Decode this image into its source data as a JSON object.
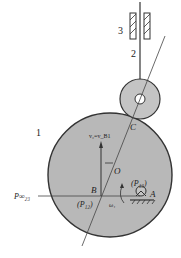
{
  "diagram": {
    "type": "cam-follower-mechanism",
    "colors": {
      "cam_fill": "#b8b8b8",
      "roller_fill": "#c4c4c4",
      "outline": "#333333",
      "background": "#ffffff"
    },
    "labels": {
      "link1": "1",
      "link2": "2",
      "link3": "3",
      "point_C": "C",
      "point_O": "O",
      "point_B": "B",
      "point_A": "A",
      "velocity": "v₂=v_B1",
      "P13": "(P₁₃)",
      "P12": "(P₁₂)",
      "P23_inf": "P∞₂₃",
      "omega": "ω₁"
    },
    "caption": "…"
  }
}
